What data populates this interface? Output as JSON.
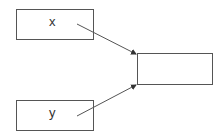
{
  "nodes": {
    "input_x": {
      "label": "x"
    },
    "input_y": {
      "label": "y"
    },
    "output": {
      "label": ""
    }
  },
  "edges": [
    {
      "from": "input_x",
      "to": "output"
    },
    {
      "from": "input_y",
      "to": "output"
    }
  ],
  "colors": {
    "stroke": "#555555",
    "text": "#333333"
  }
}
